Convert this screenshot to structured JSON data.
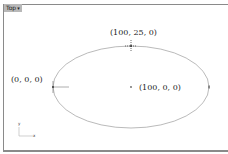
{
  "viewport": {
    "name": "Top",
    "menu_icon": "dropdown-caret-icon"
  },
  "ellipse": {
    "center_label": "(100, 0, 0)",
    "top_label": "(100, 25, 0)",
    "left_label": "(0, 0, 0)"
  },
  "axis_widget": {
    "y_label": "y",
    "x_label": "x"
  },
  "colors": {
    "frame": "#8a8a8a",
    "curve": "#a8a8a8",
    "text": "#222222"
  }
}
